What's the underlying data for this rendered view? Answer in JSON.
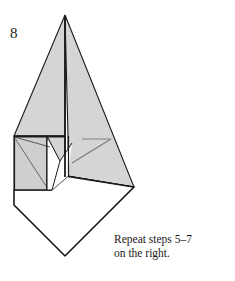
{
  "figure": {
    "step_number": "8",
    "caption_line_1": "Repeat steps 5–7",
    "caption_line_2": "on the right.",
    "colors": {
      "paper_shaded": "#d5d5d5",
      "paper_shaded_dark": "#c9c9c9",
      "paper_white": "#ffffff",
      "outline": "#1a1a1a",
      "crease_soft": "#8a8a8a",
      "background": "#ffffff"
    },
    "geometry": {
      "apex": [
        65,
        15
      ],
      "center_line_top": [
        65,
        15
      ],
      "center_line_bottom": [
        65,
        176
      ],
      "left_triangle_points": "65,15 14,136 65,136",
      "right_triangle_points": "65,15 134,187 68,176 68,136",
      "right_panel_points": "68,136 134,187 68,176",
      "left_flap_points": "14,136 65,136 65,176 52,190 14,190",
      "white_diamond_points": "14,205 65,256 134,187 68,176 52,190 14,190",
      "lower_left_panel_points": "14,136 47,136 47,190 14,190",
      "crease_v_points": "47,136 60,160 72,144",
      "right_crease_diagonal": "73,160 110,139",
      "right_crease_horizontal": "82,139 110,139",
      "left_crease_diagonal_1": "16,140 47,185",
      "left_crease_diagonal_2": "14,138 52,148"
    }
  }
}
